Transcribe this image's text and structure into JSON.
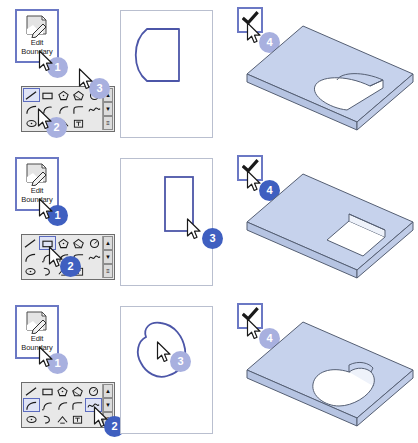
{
  "page": {
    "width": 418,
    "height": 443
  },
  "colors": {
    "selection_border": "#6b78c4",
    "toolbar_select": "#5b6bbf",
    "badge_light": "#a8b0df",
    "badge_dark": "#3f5fc0",
    "sketch_line": "#4c56a8",
    "model_face": "#c6d2ec",
    "model_edge": "#555f73",
    "canvas_border": "#b9bfcf",
    "toolbar_bg": "#e8e8e8"
  },
  "command": {
    "label_line1": "Edit",
    "label_line2": "Boundary",
    "icon": "sheet-pencil-icon"
  },
  "confirm": {
    "icon": "checkmark-icon",
    "label": "Finish Sketch"
  },
  "toolbar": {
    "name": "sketch-tools-toolbar",
    "scroll_up": "▲",
    "scroll_down": "▼",
    "grip": "≡",
    "tools": [
      {
        "id": "line",
        "name": "line-tool-icon",
        "label": "Line"
      },
      {
        "id": "rectangle",
        "name": "rectangle-tool-icon",
        "label": "Rectangle"
      },
      {
        "id": "polygon-hex",
        "name": "polygon-tool-icon",
        "label": "Polygon"
      },
      {
        "id": "pentagon",
        "name": "pentagon-tool-icon",
        "label": "Inscribed Polygon"
      },
      {
        "id": "circle",
        "name": "circle-tool-icon",
        "label": "Circle"
      },
      {
        "id": "arc",
        "name": "arc-tool-icon",
        "label": "Arc"
      },
      {
        "id": "arc-center",
        "name": "center-arc-tool-icon",
        "label": "Center-ends Arc"
      },
      {
        "id": "arc-tangent",
        "name": "tangent-arc-tool-icon",
        "label": "Tangent Arc"
      },
      {
        "id": "fillet",
        "name": "fillet-tool-icon",
        "label": "Fillet"
      },
      {
        "id": "spline",
        "name": "spline-tool-icon",
        "label": "Spline"
      },
      {
        "id": "ellipse",
        "name": "ellipse-tool-icon",
        "label": "Ellipse"
      },
      {
        "id": "partial-ellipse",
        "name": "partial-ellipse-tool-icon",
        "label": "Partial Ellipse"
      },
      {
        "id": "point",
        "name": "point-tool-icon",
        "label": "Point"
      },
      {
        "id": "text",
        "name": "text-tool-icon",
        "label": "Text"
      },
      {
        "id": "blank",
        "name": "blank-tool-slot",
        "label": ""
      }
    ]
  },
  "steps": [
    {
      "key": "row-d-shape",
      "badge_style": "light",
      "sketch": "d-shape",
      "cut": "d-shape-pocket",
      "selected_tools": [
        "line"
      ],
      "badges": {
        "command": "1",
        "toolbar": "2",
        "canvas": "3",
        "confirm": "4"
      }
    },
    {
      "key": "row-rectangle",
      "badge_style": "dark",
      "sketch": "rectangle",
      "cut": "rectangular-pocket",
      "selected_tools": [
        "rectangle"
      ],
      "badges": {
        "command": "1",
        "toolbar": "2",
        "canvas": "3",
        "confirm": "4"
      }
    },
    {
      "key": "row-freeform",
      "badge_style": "light",
      "sketch": "freeform-blob",
      "cut": "freeform-pocket",
      "selected_tools": [
        "arc",
        "spline"
      ],
      "badges": {
        "command": "1",
        "toolbar": "2",
        "canvas": "3",
        "confirm": "4"
      }
    }
  ]
}
